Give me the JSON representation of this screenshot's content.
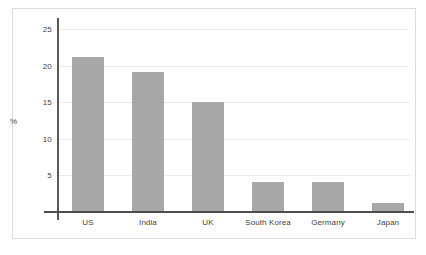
{
  "chart_data": {
    "type": "bar",
    "title": "",
    "subtitle": "",
    "xlabel": "",
    "ylabel": "%",
    "categories": [
      "US",
      "India",
      "UK",
      "South Korea",
      "Germany",
      "Japan"
    ],
    "values": [
      21.2,
      19.1,
      15.1,
      4.1,
      4.1,
      1.3
    ],
    "ylim": [
      0,
      26
    ],
    "yticks": [
      5,
      10,
      15,
      20,
      25
    ],
    "ytick_labels": [
      "5",
      "10",
      "15",
      "20",
      "25"
    ],
    "grid": "horizontal",
    "legend": "none",
    "series": [
      {
        "name": "",
        "values": [
          21.2,
          19.1,
          15.1,
          4.1,
          4.1,
          1.3
        ]
      }
    ],
    "colors": {
      "bar_fill": "#a8a8a8",
      "gridline": "#e9e9e9",
      "axis": "#4d4d4d",
      "text": "#3f3f3f",
      "frame": "#dcdcdc",
      "background": "#ffffff"
    }
  }
}
